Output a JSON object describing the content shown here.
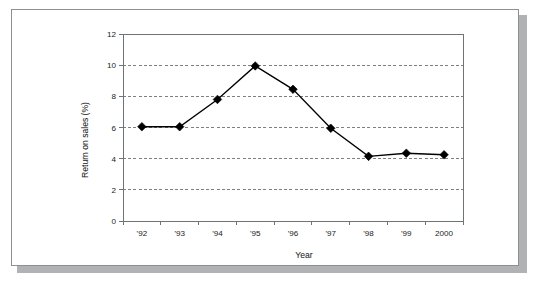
{
  "figure": {
    "background_color": "#ffffff",
    "frame_border_color": "#8d9092",
    "shadow_color": "#b0b2b3",
    "series_color": "#000000",
    "grid_color": "#7b8083"
  },
  "chart_data": {
    "type": "line",
    "title": "",
    "subtitle": "",
    "xlabel": "Year",
    "ylabel": "Return on sales (%)",
    "categories": [
      "'92",
      "'93",
      "'94",
      "'95",
      "'96",
      "'97",
      "'98",
      "'99",
      "2000"
    ],
    "values": [
      6.05,
      6.05,
      7.8,
      9.95,
      8.45,
      5.95,
      4.15,
      4.35,
      4.25
    ],
    "series": [
      {
        "name": "Return on sales",
        "values": [
          6.05,
          6.05,
          7.8,
          9.95,
          8.45,
          5.95,
          4.15,
          4.35,
          4.25
        ],
        "marker": "diamond",
        "color": "#000000"
      }
    ],
    "ylim": [
      0,
      12
    ],
    "yticks": [
      0,
      2,
      4,
      6,
      8,
      10,
      12
    ],
    "ytick_labels": [
      "0",
      "2",
      "4",
      "6",
      "8",
      "10",
      "12"
    ],
    "grid": "horizontal-dashed",
    "legend": "none",
    "annotations": []
  }
}
